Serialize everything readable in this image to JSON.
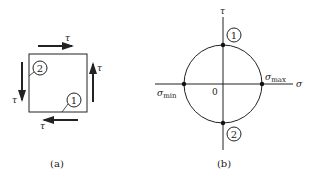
{
  "figure_a": {
    "caption": "(a)",
    "element_labels": {
      "tau_top": "τ",
      "tau_right": "τ",
      "tau_left": "τ",
      "tau_bottom": "τ"
    },
    "points": [
      {
        "id": "1",
        "label": "1",
        "location": "bottom face"
      },
      {
        "id": "2",
        "label": "2",
        "location": "left face"
      }
    ]
  },
  "figure_b": {
    "caption": "(b)",
    "axes": {
      "horizontal": "σ",
      "vertical": "τ",
      "origin": "0"
    },
    "labels": {
      "sigma_min": "σ",
      "sigma_min_sub": "min",
      "sigma_max": "σ",
      "sigma_max_sub": "max"
    },
    "points": [
      {
        "id": "1",
        "label": "1",
        "location": "top of circle"
      },
      {
        "id": "2",
        "label": "2",
        "location": "bottom of circle"
      }
    ]
  },
  "colors": {
    "ink": "#222222",
    "background": "#ffffff"
  }
}
